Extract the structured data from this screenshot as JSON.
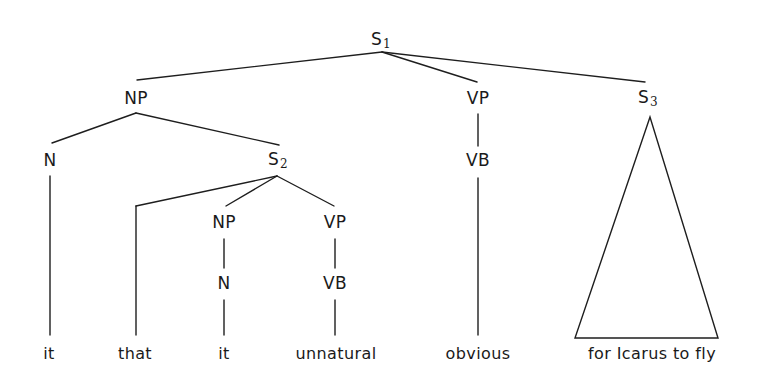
{
  "diagram": {
    "type": "syntax-tree",
    "title": "",
    "nodes": {
      "s1": {
        "label": "S",
        "sub": "1",
        "x": 381,
        "y": 40
      },
      "np1": {
        "label": "NP",
        "sub": "",
        "x": 136,
        "y": 98
      },
      "vp1": {
        "label": "VP",
        "sub": "",
        "x": 478,
        "y": 98
      },
      "s3": {
        "label": "S",
        "sub": "3",
        "x": 648,
        "y": 98
      },
      "n1": {
        "label": "N",
        "sub": "",
        "x": 50,
        "y": 160
      },
      "s2": {
        "label": "S",
        "sub": "2",
        "x": 278,
        "y": 160
      },
      "vb1": {
        "label": "VB",
        "sub": "",
        "x": 478,
        "y": 160
      },
      "np2": {
        "label": "NP",
        "sub": "",
        "x": 224,
        "y": 222
      },
      "vp2": {
        "label": "VP",
        "sub": "",
        "x": 335,
        "y": 222
      },
      "n2": {
        "label": "N",
        "sub": "",
        "x": 224,
        "y": 283
      },
      "vb2": {
        "label": "VB",
        "sub": "",
        "x": 335,
        "y": 283
      }
    },
    "leaves": [
      {
        "text": "it",
        "x": 49,
        "y": 354
      },
      {
        "text": "that",
        "x": 135,
        "y": 354
      },
      {
        "text": "it",
        "x": 224,
        "y": 354
      },
      {
        "text": "unnatural",
        "x": 336,
        "y": 354
      },
      {
        "text": "obvious",
        "x": 478,
        "y": 354
      },
      {
        "text": "for Icarus to fly",
        "x": 652,
        "y": 354
      }
    ],
    "edges": [
      {
        "from": "S1",
        "to": "NP",
        "x1": 382,
        "y1": 52,
        "x2": 137,
        "y2": 80
      },
      {
        "from": "S1",
        "to": "VP",
        "x1": 382,
        "y1": 52,
        "x2": 477,
        "y2": 82
      },
      {
        "from": "S1",
        "to": "S3",
        "x1": 382,
        "y1": 52,
        "x2": 645,
        "y2": 82
      },
      {
        "from": "NP",
        "to": "N",
        "x1": 136,
        "y1": 113,
        "x2": 52,
        "y2": 143
      },
      {
        "from": "NP",
        "to": "S2",
        "x1": 136,
        "y1": 113,
        "x2": 279,
        "y2": 145
      },
      {
        "from": "VP",
        "to": "VB",
        "x1": 478,
        "y1": 114,
        "x2": 478,
        "y2": 146
      },
      {
        "from": "N",
        "to": "it",
        "x1": 50,
        "y1": 176,
        "x2": 50,
        "y2": 335
      },
      {
        "from": "S2",
        "to": "that-elbow",
        "x1": 277,
        "y1": 176,
        "x2": 136,
        "y2": 206
      },
      {
        "from": "that-elbow",
        "to": "that",
        "x1": 136,
        "y1": 206,
        "x2": 136,
        "y2": 335
      },
      {
        "from": "S2",
        "to": "NP2",
        "x1": 277,
        "y1": 176,
        "x2": 226,
        "y2": 206
      },
      {
        "from": "S2",
        "to": "VP2",
        "x1": 277,
        "y1": 176,
        "x2": 334,
        "y2": 206
      },
      {
        "from": "NP2",
        "to": "N2",
        "x1": 224,
        "y1": 239,
        "x2": 224,
        "y2": 268
      },
      {
        "from": "VP2",
        "to": "VB2",
        "x1": 335,
        "y1": 239,
        "x2": 335,
        "y2": 268
      },
      {
        "from": "N2",
        "to": "it",
        "x1": 224,
        "y1": 300,
        "x2": 224,
        "y2": 335
      },
      {
        "from": "VB2",
        "to": "unnatural",
        "x1": 335,
        "y1": 300,
        "x2": 335,
        "y2": 335
      },
      {
        "from": "VB",
        "to": "obvious",
        "x1": 478,
        "y1": 178,
        "x2": 478,
        "y2": 335
      }
    ],
    "triangle": {
      "for": "S3",
      "covers": "for Icarus to fly",
      "apex": [
        650,
        117
      ],
      "base_left": [
        575,
        338
      ],
      "base_right": [
        718,
        338
      ]
    }
  }
}
